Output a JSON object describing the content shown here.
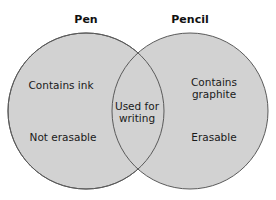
{
  "diagram": {
    "type": "venn",
    "colors": {
      "fill": "#d2d2d2",
      "stroke": "#5a5a5a",
      "background": "#ffffff",
      "text": "#1a1a1a"
    },
    "sets": [
      {
        "id": "pen",
        "title": "Pen",
        "cx": 86,
        "cy": 111,
        "r": 78,
        "unique_items": [
          "Contains ink",
          "Not erasable"
        ]
      },
      {
        "id": "pencil",
        "title": "Pencil",
        "cx": 190,
        "cy": 111,
        "r": 78,
        "unique_items": [
          "Contains graphite",
          "Erasable"
        ]
      }
    ],
    "intersection": {
      "items": [
        "Used for writing"
      ]
    }
  },
  "labels": {
    "pen_title": "Pen",
    "pencil_title": "Pencil",
    "pen_item_1": "Contains ink",
    "pen_item_2": "Not erasable",
    "pencil_item_1_line1": "Contains",
    "pencil_item_1_line2": "graphite",
    "pencil_item_2": "Erasable",
    "shared_line1": "Used for",
    "shared_line2": "writing"
  }
}
